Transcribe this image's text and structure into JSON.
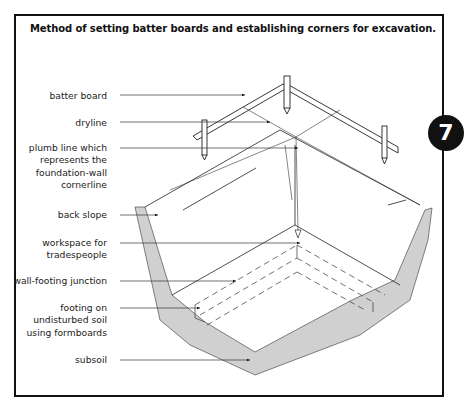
{
  "figure": {
    "title": "Method of setting batter boards and establishing corners for excavation.",
    "badge_number": "7",
    "labels": [
      {
        "id": "batter-board",
        "lines": [
          "batter board"
        ]
      },
      {
        "id": "dryline",
        "lines": [
          "dryline"
        ]
      },
      {
        "id": "plumb-line",
        "lines": [
          "plumb line which",
          "represents the",
          "foundation-wall",
          "cornerline"
        ]
      },
      {
        "id": "back-slope",
        "lines": [
          "back slope"
        ]
      },
      {
        "id": "workspace",
        "lines": [
          "workspace for",
          "tradespeople"
        ]
      },
      {
        "id": "wall-footing-junction",
        "lines": [
          "wall-footing junction"
        ]
      },
      {
        "id": "footing",
        "lines": [
          "footing on",
          "undisturbed soil",
          "using formboards"
        ]
      },
      {
        "id": "subsoil",
        "lines": [
          "subsoil"
        ]
      }
    ]
  },
  "colors": {
    "ink": "#111111",
    "line": "#333333",
    "background": "#ffffff"
  }
}
